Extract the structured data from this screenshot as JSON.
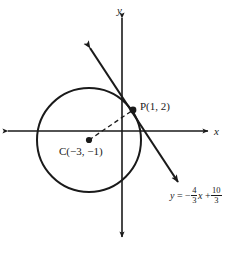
{
  "figure": {
    "type": "coordinate-geometry-diagram",
    "background_color": "#ffffff",
    "stroke_color": "#1a1a1a",
    "width": 247,
    "height": 253
  },
  "axes": {
    "x_label": "x",
    "y_label": "y",
    "x_axis": {
      "y_pixel": 131,
      "x_start": 8,
      "x_end": 208,
      "arrows": "both"
    },
    "y_axis": {
      "x_pixel": 122,
      "y_start": 18,
      "y_end": 237,
      "arrows": "both"
    }
  },
  "circle": {
    "center_pixel": {
      "x": 89,
      "y": 140
    },
    "radius_pixel": 52,
    "center_label": "C(−3, −1)",
    "center_point": {
      "x": -3,
      "y": -1
    }
  },
  "point": {
    "label": "P(1, 2)",
    "coords": {
      "x": 1,
      "y": 2
    },
    "pixel": {
      "x": 133,
      "y": 110
    }
  },
  "radius_segment": {
    "style": "dashed",
    "from_pixel": {
      "x": 89,
      "y": 140
    },
    "to_pixel": {
      "x": 133,
      "y": 110
    }
  },
  "tangent_line": {
    "equation_parts": {
      "lhs": "y",
      "equals": "=",
      "minus": "−",
      "slope_num": "4",
      "slope_den": "3",
      "variable": "x",
      "plus": "+",
      "intercept_num": "10",
      "intercept_den": "3"
    },
    "equation_text": "y = −4/3 x + 10/3",
    "slope": "-4/3",
    "y_intercept": "10/3",
    "arrow_start_pixel": {
      "x": 90,
      "y": 48
    },
    "arrow_end_pixel": {
      "x": 178,
      "y": 182
    },
    "arrows": "both"
  }
}
